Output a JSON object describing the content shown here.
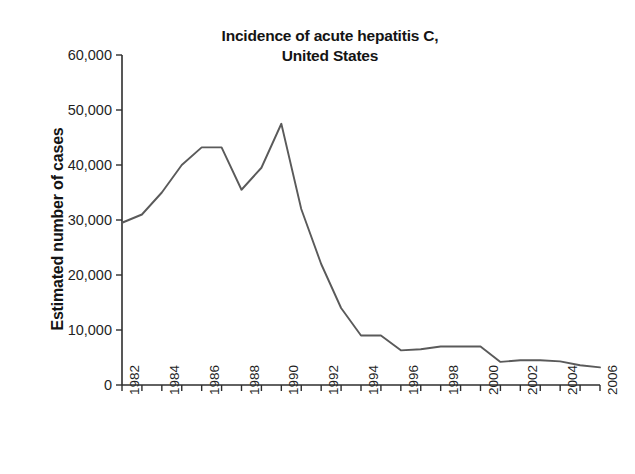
{
  "chart_data": {
    "type": "line",
    "title": "Incidence of acute hepatitis C, United States",
    "title_line1": "Incidence of acute hepatitis C,",
    "title_line2": "United States",
    "xlabel": "",
    "ylabel": "Estimated number of cases",
    "ylim": [
      0,
      60000
    ],
    "xlim": [
      1982,
      2006
    ],
    "grid": false,
    "legend": "none",
    "ytick_labels": [
      "0",
      "10,000",
      "20,000",
      "30,000",
      "40,000",
      "50,000",
      "60,000"
    ],
    "ytick_values": [
      0,
      10000,
      20000,
      30000,
      40000,
      50000,
      60000
    ],
    "xtick_labels": [
      "1982",
      "1984",
      "1986",
      "1988",
      "1990",
      "1992",
      "1994",
      "1996",
      "1998",
      "2000",
      "2002",
      "2004",
      "2006"
    ],
    "xtick_values": [
      1982,
      1984,
      1986,
      1988,
      1990,
      1992,
      1994,
      1996,
      1998,
      2000,
      2002,
      2004,
      2006
    ],
    "x": [
      1982,
      1983,
      1984,
      1985,
      1986,
      1987,
      1988,
      1989,
      1990,
      1991,
      1992,
      1993,
      1994,
      1995,
      1996,
      1997,
      1998,
      1999,
      2000,
      2001,
      2002,
      2003,
      2004,
      2005,
      2006
    ],
    "values": [
      29500,
      31000,
      35000,
      40000,
      43200,
      43200,
      35500,
      39500,
      47500,
      32000,
      22000,
      14000,
      9000,
      9000,
      6300,
      6500,
      7000,
      7000,
      7000,
      4200,
      4500,
      4500,
      4300,
      3600,
      3200
    ],
    "series": [
      {
        "name": "Estimated number of cases",
        "color": "#5a5a5a",
        "values": [
          29500,
          31000,
          35000,
          40000,
          43200,
          43200,
          35500,
          39500,
          47500,
          32000,
          22000,
          14000,
          9000,
          9000,
          6300,
          6500,
          7000,
          7000,
          7000,
          4200,
          4500,
          4500,
          4300,
          3600,
          3200
        ]
      }
    ]
  },
  "colors": {
    "line": "#5a5a5a",
    "axis": "#2e2e2e",
    "text": "#141414",
    "background": "#ffffff"
  }
}
